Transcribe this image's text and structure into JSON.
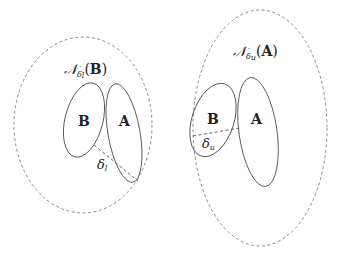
{
  "diagram": {
    "left_panel": {
      "neighborhood_label": {
        "symbol": "𝒩",
        "subscript_symbol": "δ",
        "subscript_index": "l",
        "open_paren": "(",
        "argument": "B",
        "close_paren": ")"
      },
      "set_b_label": "B",
      "set_a_label": "A",
      "distance_label": {
        "symbol": "δ",
        "subscript": "l"
      }
    },
    "right_panel": {
      "neighborhood_label": {
        "symbol": "𝒩",
        "subscript_symbol": "δ",
        "subscript_index": "u",
        "open_paren": "(",
        "argument": "A",
        "close_paren": ")"
      },
      "set_b_label": "B",
      "set_a_label": "A",
      "distance_label": {
        "symbol": "δ",
        "subscript": "u"
      }
    },
    "colors": {
      "neighborhood_stroke": "#8a8a8a",
      "set_stroke": "#555555",
      "text": "#222222",
      "background": "#ffffff"
    }
  }
}
